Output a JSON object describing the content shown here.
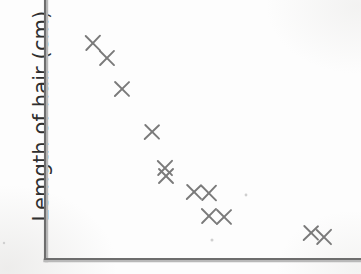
{
  "figure": {
    "kind": "scatter-plot",
    "background_color": "#fdfdfd",
    "axis_color": "#6d6d6d",
    "marker_color": "#7a7a7a",
    "y_axis_title": "Lemgth of hair (cm)",
    "x_axis_title": "",
    "title": ""
  },
  "axes": {
    "y_axis_x_px": 45,
    "y_axis_top_px": 0,
    "y_axis_bottom_px": 259,
    "x_axis_y_px": 259,
    "x_axis_left_px": 45,
    "x_axis_right_px": 361,
    "tick_labels_x": [],
    "tick_labels_y": [],
    "grid": false
  },
  "chart_data": {
    "type": "scatter",
    "title": "",
    "xlabel": "",
    "ylabel": "Lemgth of hair (cm)",
    "xlim": [
      0,
      361
    ],
    "ylim": [
      0,
      274
    ],
    "grid": false,
    "legend": null,
    "marker": "x",
    "marker_color": "#7a7a7a",
    "n_points": 12,
    "points_px": [
      {
        "x": 93,
        "y": 43
      },
      {
        "x": 107,
        "y": 58
      },
      {
        "x": 122,
        "y": 89
      },
      {
        "x": 152,
        "y": 132
      },
      {
        "x": 165,
        "y": 168
      },
      {
        "x": 166,
        "y": 176
      },
      {
        "x": 194,
        "y": 192
      },
      {
        "x": 209,
        "y": 193
      },
      {
        "x": 209,
        "y": 216
      },
      {
        "x": 224,
        "y": 217
      },
      {
        "x": 311,
        "y": 233
      },
      {
        "x": 324,
        "y": 237
      }
    ],
    "points_data": [
      {
        "x": 15.2,
        "y": 85.5
      },
      {
        "x": 19.6,
        "y": 79.7
      },
      {
        "x": 24.4,
        "y": 67.8
      },
      {
        "x": 33.9,
        "y": 51.2
      },
      {
        "x": 38.0,
        "y": 37.3
      },
      {
        "x": 38.3,
        "y": 34.2
      },
      {
        "x": 47.2,
        "y": 28.0
      },
      {
        "x": 51.9,
        "y": 27.6
      },
      {
        "x": 51.9,
        "y": 18.7
      },
      {
        "x": 56.6,
        "y": 18.3
      },
      {
        "x": 84.2,
        "y": 11.7
      },
      {
        "x": 88.3,
        "y": 10.2
      }
    ]
  },
  "specks": [
    {
      "x": 246,
      "y": 195,
      "r": 1.4
    },
    {
      "x": 212,
      "y": 240,
      "r": 1.5
    },
    {
      "x": 4,
      "y": 243,
      "r": 1.2
    }
  ]
}
